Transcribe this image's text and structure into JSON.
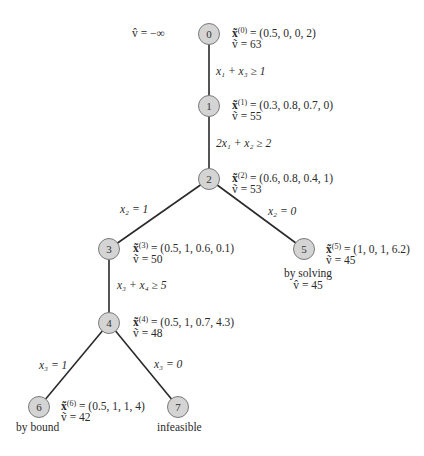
{
  "root_bound": "v̂ = −∞",
  "nodes": [
    {
      "id": "0",
      "x_label": "x̃",
      "sup": "(0)",
      "x_value": " = (0.5, 0, 0, 2)",
      "v_line": "ṽ = 63"
    },
    {
      "id": "1",
      "x_label": "x̃",
      "sup": "(1)",
      "x_value": " = (0.3, 0.8, 0.7, 0)",
      "v_line": "ṽ = 55"
    },
    {
      "id": "2",
      "x_label": "x̃",
      "sup": "(2)",
      "x_value": " = (0.6, 0.8, 0.4, 1)",
      "v_line": "ṽ = 53"
    },
    {
      "id": "3",
      "x_label": "x̃",
      "sup": "(3)",
      "x_value": " = (0.5, 1, 0.6, 0.1)",
      "v_line": "ṽ = 50"
    },
    {
      "id": "4",
      "x_label": "x̃",
      "sup": "(4)",
      "x_value": " = (0.5, 1, 0.7, 4.3)",
      "v_line": "ṽ = 48"
    },
    {
      "id": "5",
      "x_label": "x̃",
      "sup": "(5)",
      "x_value": " = (1, 0, 1, 6.2)",
      "v_line": "ṽ = 45"
    },
    {
      "id": "6",
      "x_label": "x̃",
      "sup": "(6)",
      "x_value": " = (0.5, 1, 1, 4)",
      "v_line": "ṽ = 42"
    },
    {
      "id": "7"
    }
  ],
  "edges": [
    {
      "from": "0",
      "to": "1",
      "label": "x₁ + x₃ ≥ 1"
    },
    {
      "from": "1",
      "to": "2",
      "label": "2x₁ + x₂ ≥ 2"
    },
    {
      "from": "2",
      "to": "3",
      "label": "x₂ = 1"
    },
    {
      "from": "2",
      "to": "5",
      "label": "x₂ = 0"
    },
    {
      "from": "3",
      "to": "4",
      "label": "x₃ + x₄ ≥ 5"
    },
    {
      "from": "4",
      "to": "6",
      "label": "x₃ = 1"
    },
    {
      "from": "4",
      "to": "7",
      "label": "x₃ = 0"
    }
  ],
  "notes": {
    "node5_line1": "by solving",
    "node5_line2": "v̂ = 45",
    "node6": "by bound",
    "node7": "infeasible"
  },
  "colors": {
    "node_fill": "#d4d4d4",
    "node_stroke": "#7a7a7a",
    "edge": "#2a2a2a"
  }
}
